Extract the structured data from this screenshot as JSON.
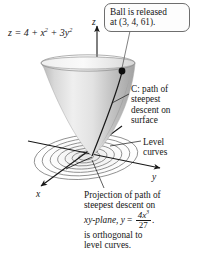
{
  "figure": {
    "kind": "3d-surface-plot",
    "surface_equation": "z = 4 + x² + 3y²",
    "equation_parts": {
      "lhs": "z",
      "eq": "=",
      "c": "4",
      "x2": "x",
      "y2": "3y"
    },
    "callout": {
      "line1": "Ball is released",
      "line2": "at (3, 4, 61)."
    },
    "label_path": {
      "line1": "C: path of",
      "line2": "steepest",
      "line3": "descent on",
      "line4": "surface"
    },
    "label_level": {
      "line1": "Level",
      "line2": "curves"
    },
    "caption": {
      "line1": "Projection of path of",
      "line2": "steepest descent on",
      "line3a": "xy-plane, y",
      "line3b": "=",
      "numerator": "4x",
      "numerator_exp": "3",
      "denominator": "27",
      "line3c": ".",
      "line4": "is orthogonal to",
      "line5": "level curves."
    },
    "axes": {
      "z": "z",
      "y": "y",
      "x": "x"
    },
    "ball_point": {
      "x": 3,
      "y": 4,
      "z": 61
    },
    "level_curve_count": 7,
    "colors": {
      "surface_light": "#e9e9e9",
      "surface_mid": "#c9c9c9",
      "surface_dark": "#9d9d9d",
      "rim": "#f4f4f4",
      "ink": "#171717",
      "contour": "#7a7a7a",
      "callout_border": "#6e6e6e",
      "background": "#ffffff"
    }
  }
}
